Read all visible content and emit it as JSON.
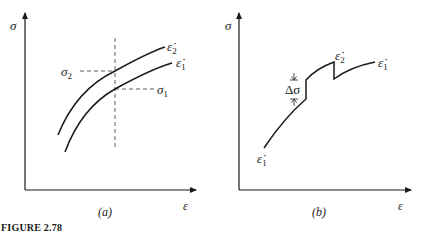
{
  "figure": {
    "caption": "FIGURE 2.78",
    "panels": [
      {
        "id": "a",
        "label": "(a)",
        "y_axis_label": "σ",
        "x_axis_label": "ε",
        "curves": [
          {
            "name": "upper-curve",
            "label": "ε̇",
            "subscript": "2"
          },
          {
            "name": "lower-curve",
            "label": "ε̇",
            "subscript": "1"
          }
        ],
        "stress_labels": [
          {
            "name": "sigma-2",
            "label": "σ",
            "subscript": "2"
          },
          {
            "name": "sigma-1",
            "label": "σ",
            "subscript": "1"
          }
        ]
      },
      {
        "id": "b",
        "label": "(b)",
        "y_axis_label": "σ",
        "x_axis_label": "ε",
        "jump_label": "Δσ",
        "rate_labels": [
          {
            "name": "start-rate",
            "label": "ε̇",
            "subscript": "1"
          },
          {
            "name": "mid-rate",
            "label": "ε̇",
            "subscript": "2"
          },
          {
            "name": "end-rate",
            "label": "ε̇",
            "subscript": "1"
          }
        ]
      }
    ]
  }
}
